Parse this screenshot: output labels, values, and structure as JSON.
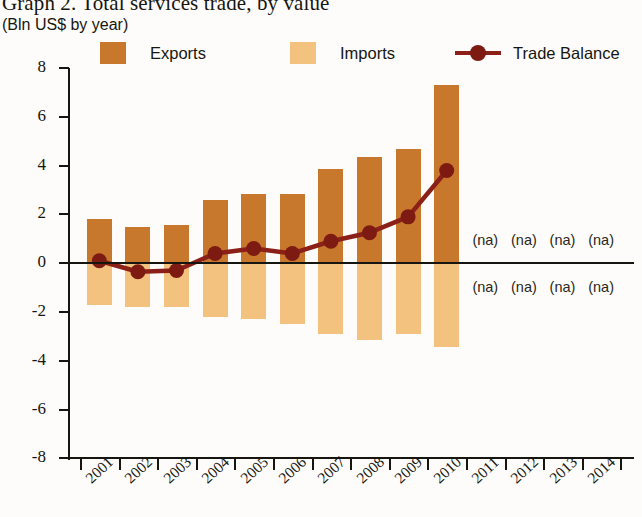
{
  "header": {
    "title": "Graph 2. Total services trade, by value",
    "subtitle": "(Bln US$ by year)"
  },
  "legend": {
    "items": [
      {
        "label": "Exports",
        "color": "#c8782c",
        "marker": "square-swatch"
      },
      {
        "label": "Imports",
        "color": "#f2c27e",
        "marker": "square-swatch"
      },
      {
        "label": "Trade Balance",
        "color": "#8a2018",
        "marker": "line-dot"
      }
    ]
  },
  "colors": {
    "exports": "#c8782c",
    "imports": "#f2c27e",
    "balance": "#8a2018",
    "axis": "#16150f",
    "background": "#fdfcfa"
  },
  "chart_data": {
    "type": "bar",
    "title": "Graph 2. Total services trade, by value",
    "subtitle": "(Bln US$ by year)",
    "xlabel": "",
    "ylabel": "Bln US$",
    "ylim": [
      -8,
      8
    ],
    "ytick_step": 2,
    "yticks": [
      8,
      6,
      4,
      2,
      0,
      -2,
      -4,
      -6,
      -8
    ],
    "ytick_labels": [
      "8",
      "6",
      "4",
      "2",
      "0",
      "-2",
      "-4",
      "-6",
      "-8"
    ],
    "grid": false,
    "legend_position": "top",
    "categories": [
      "2001",
      "2002",
      "2003",
      "2004",
      "2005",
      "2006",
      "2007",
      "2008",
      "2009",
      "2010",
      "2011",
      "2012",
      "2013",
      "2014"
    ],
    "series": [
      {
        "name": "Exports",
        "type": "bar",
        "color": "#c8782c",
        "values": [
          1.8,
          1.5,
          1.55,
          2.6,
          2.85,
          2.85,
          3.85,
          4.35,
          4.7,
          7.3,
          null,
          null,
          null,
          null
        ]
      },
      {
        "name": "Imports",
        "type": "bar",
        "color": "#f2c27e",
        "values": [
          -1.7,
          -1.8,
          -1.8,
          -2.2,
          -2.3,
          -2.5,
          -2.9,
          -3.15,
          -2.9,
          -3.45,
          null,
          null,
          null,
          null
        ]
      },
      {
        "name": "Trade Balance",
        "type": "line",
        "color": "#8a2018",
        "values": [
          0.1,
          -0.35,
          -0.3,
          0.4,
          0.6,
          0.4,
          0.9,
          1.25,
          1.9,
          3.8,
          null,
          null,
          null,
          null
        ]
      }
    ],
    "annotations": [
      {
        "text": "(na)",
        "category": "2011",
        "position": "above-zero"
      },
      {
        "text": "(na)",
        "category": "2012",
        "position": "above-zero"
      },
      {
        "text": "(na)",
        "category": "2013",
        "position": "above-zero"
      },
      {
        "text": "(na)",
        "category": "2014",
        "position": "above-zero"
      },
      {
        "text": "(na)",
        "category": "2011",
        "position": "below-zero"
      },
      {
        "text": "(na)",
        "category": "2012",
        "position": "below-zero"
      },
      {
        "text": "(na)",
        "category": "2013",
        "position": "below-zero"
      },
      {
        "text": "(na)",
        "category": "2014",
        "position": "below-zero"
      }
    ]
  }
}
